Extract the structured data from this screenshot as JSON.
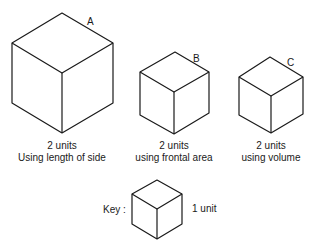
{
  "cubes": [
    {
      "id": "A",
      "label": "A",
      "line1": "2 units",
      "line2": "Using length of side"
    },
    {
      "id": "B",
      "label": "B",
      "line1": "2 units",
      "line2": "using frontal area"
    },
    {
      "id": "C",
      "label": "C",
      "line1": "2 units",
      "line2": "using volume"
    }
  ],
  "key": {
    "label": "Key :",
    "value": "1 unit"
  }
}
